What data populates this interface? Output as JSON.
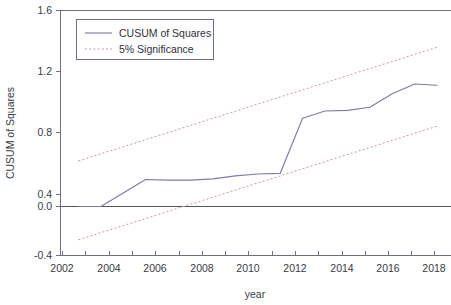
{
  "chart_data": {
    "type": "line",
    "title": "",
    "xlabel": "year",
    "ylabel": "CUSUM of Squares",
    "xlim": [
      2001.2,
      2018.6
    ],
    "ylim": [
      -0.4,
      1.6
    ],
    "grid": false,
    "legend_position": "top-left",
    "x_tick_labels": [
      "2002",
      "2004",
      "2006",
      "2008",
      "2010",
      "2012",
      "2014",
      "2016",
      "2018"
    ],
    "x_tick_values": [
      2002,
      2004,
      2006,
      2008,
      2010,
      2012,
      2014,
      2016,
      2018
    ],
    "x_minor_tick_values": [
      2003,
      2005,
      2007,
      2009,
      2011,
      2013,
      2015,
      2017
    ],
    "y_tick_labels": [
      "1.6",
      "1.2",
      "0.8",
      "0.4",
      "0.0",
      "-0.4"
    ],
    "y_tick_values": [
      1.6,
      1.2,
      0.8,
      0.4,
      0.0,
      -0.4
    ],
    "x": [
      2002,
      2003,
      2004,
      2005,
      2006,
      2007,
      2008,
      2009,
      2010,
      2011,
      2012,
      2013,
      2014,
      2015,
      2016,
      2017,
      2018
    ],
    "series": [
      {
        "name": "CUSUM of Squares",
        "style": "solid",
        "color": "#7c7ca8",
        "values": [
          0.0,
          0.0,
          0.11,
          0.22,
          0.215,
          0.215,
          0.225,
          0.25,
          0.265,
          0.27,
          0.72,
          0.78,
          0.785,
          0.81,
          0.92,
          1.0,
          0.99
        ]
      },
      {
        "name": "5% Significance",
        "style": "dotted",
        "color": "#c6a0ad",
        "band": "upper",
        "values": [
          0.372,
          0.43,
          0.488,
          0.546,
          0.604,
          0.662,
          0.72,
          0.778,
          0.836,
          0.894,
          0.952,
          1.01,
          1.068,
          1.126,
          1.184,
          1.242,
          1.3
        ]
      },
      {
        "name": "5% Significance",
        "style": "dotted",
        "color": "#c6a0ad",
        "band": "lower",
        "values": [
          -0.272,
          -0.214,
          -0.156,
          -0.098,
          -0.04,
          0.018,
          0.076,
          0.134,
          0.192,
          0.25,
          0.308,
          0.366,
          0.424,
          0.482,
          0.54,
          0.598,
          0.656
        ]
      }
    ]
  },
  "legend": {
    "entries": [
      {
        "label": "CUSUM of Squares",
        "marker": "solid-line"
      },
      {
        "label": "5% Significance",
        "marker": "dotted-line"
      }
    ]
  },
  "axes": {
    "x_title": "year",
    "y_title": "CUSUM of Squares"
  },
  "colors": {
    "cusum_line": "#7c7ca8",
    "significance_line": "#c6a0ad",
    "axis": "#6f6f80",
    "text": "#3a3a46",
    "background": "#ffffff"
  }
}
